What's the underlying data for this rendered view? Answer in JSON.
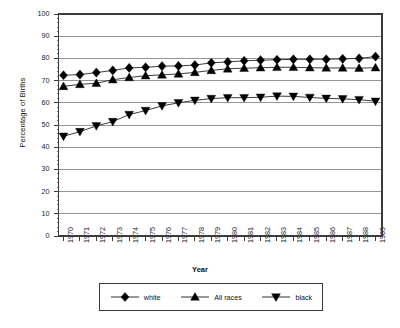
{
  "chart_data": {
    "type": "line",
    "title": "",
    "xlabel": "Year",
    "ylabel": "Percentage of Births",
    "ylim": [
      0,
      100
    ],
    "ytick_step": 10,
    "grid": "horizontal",
    "legend_position": "bottom",
    "categories": [
      "1970",
      "1971",
      "1972",
      "1973",
      "1974",
      "1975",
      "1976",
      "1977",
      "1978",
      "1979",
      "1980",
      "1981",
      "1982",
      "1983",
      "1984",
      "1985",
      "1986",
      "1987",
      "1988",
      "1989"
    ],
    "yticks": [
      "0",
      "10",
      "20",
      "30",
      "40",
      "50",
      "60",
      "70",
      "80",
      "90",
      "100"
    ],
    "series": [
      {
        "name": "white",
        "marker": "diamond",
        "values": [
          72.4,
          72.7,
          73.6,
          74.6,
          75.7,
          76.0,
          76.5,
          76.6,
          77.0,
          78.0,
          78.4,
          78.9,
          79.2,
          79.4,
          79.6,
          79.6,
          79.6,
          79.8,
          80.0,
          80.8
        ]
      },
      {
        "name": "All races",
        "marker": "triangle-up",
        "values": [
          67.4,
          68.3,
          68.8,
          70.4,
          71.4,
          72.2,
          72.6,
          73.0,
          73.7,
          74.6,
          75.3,
          75.6,
          75.8,
          76.0,
          76.0,
          75.8,
          75.7,
          75.7,
          75.6,
          75.8
        ]
      },
      {
        "name": "black",
        "marker": "triangle-down",
        "values": [
          44.9,
          47.0,
          49.6,
          51.5,
          54.7,
          56.5,
          58.6,
          60.0,
          61.1,
          61.9,
          62.3,
          62.3,
          62.5,
          63.0,
          62.9,
          62.4,
          62.0,
          61.8,
          61.4,
          60.7
        ]
      }
    ]
  },
  "legend": {
    "items": [
      {
        "label": "white",
        "icon": "diamond-marker"
      },
      {
        "label": "All races",
        "icon": "triangle-up-marker"
      },
      {
        "label": "black",
        "icon": "triangle-down-marker"
      }
    ]
  }
}
